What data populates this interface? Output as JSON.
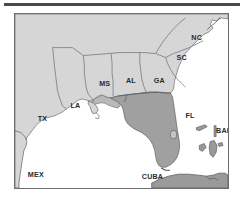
{
  "figure": {
    "kind": "reference-map",
    "width": 243,
    "height": 205
  },
  "colors": {
    "top_rule": "#4a4a4a",
    "frame_border": "#6e6e6e",
    "water": "#ffffff",
    "land_light": "#d6d6d6",
    "land_mid": "#b9b9b9",
    "land_dark": "#a0a0a0",
    "island_dark": "#9a9a9a",
    "state_border": "#6b6b6b",
    "coast_line": "#4f4f4f",
    "label_text": "#2b2b2b"
  },
  "map": {
    "frame": {
      "left": 14,
      "top": 13,
      "width": 215,
      "height": 176
    },
    "labels": [
      {
        "id": "label-nc",
        "text": "NC",
        "x": 178,
        "y": 26,
        "size": "normal"
      },
      {
        "id": "label-sc",
        "text": "SC",
        "x": 163,
        "y": 47,
        "size": "normal"
      },
      {
        "id": "label-ga",
        "text": "GA",
        "x": 140,
        "y": 70,
        "size": "normal"
      },
      {
        "id": "label-al",
        "text": "AL",
        "x": 112,
        "y": 70,
        "size": "normal"
      },
      {
        "id": "label-ms",
        "text": "MS",
        "x": 85,
        "y": 73,
        "size": "normal"
      },
      {
        "id": "label-la",
        "text": "LA",
        "x": 56,
        "y": 95,
        "size": "normal"
      },
      {
        "id": "label-tx",
        "text": "TX",
        "x": 23,
        "y": 108,
        "size": "normal"
      },
      {
        "id": "label-fl",
        "text": "FL",
        "x": 172,
        "y": 105,
        "size": "normal"
      },
      {
        "id": "label-bah",
        "text": "BAH",
        "x": 203,
        "y": 120,
        "size": "normal"
      },
      {
        "id": "label-mex",
        "text": "MEX",
        "x": 13,
        "y": 165,
        "size": "normal"
      },
      {
        "id": "label-cuba",
        "text": "CUBA",
        "x": 128,
        "y": 167,
        "size": "normal"
      }
    ],
    "regions": [
      {
        "id": "region-texas",
        "name": "TX",
        "tone": "land_light"
      },
      {
        "id": "region-louisiana",
        "name": "LA",
        "tone": "land_light"
      },
      {
        "id": "region-mississippi",
        "name": "MS",
        "tone": "land_light"
      },
      {
        "id": "region-alabama",
        "name": "AL",
        "tone": "land_light"
      },
      {
        "id": "region-georgia",
        "name": "GA",
        "tone": "land_light"
      },
      {
        "id": "region-south-carolina",
        "name": "SC",
        "tone": "land_light"
      },
      {
        "id": "region-north-carolina",
        "name": "NC",
        "tone": "land_light"
      },
      {
        "id": "region-florida",
        "name": "FL",
        "tone": "land_dark"
      },
      {
        "id": "region-mexico",
        "name": "MEX",
        "tone": "land_light"
      },
      {
        "id": "region-cuba",
        "name": "CUBA",
        "tone": "island_dark"
      },
      {
        "id": "region-bahamas",
        "name": "BAH",
        "tone": "island_dark"
      }
    ],
    "water_bodies": [
      {
        "id": "water-gulf-of-mexico",
        "name": "Gulf of Mexico"
      },
      {
        "id": "water-atlantic",
        "name": "Atlantic Ocean"
      }
    ]
  }
}
